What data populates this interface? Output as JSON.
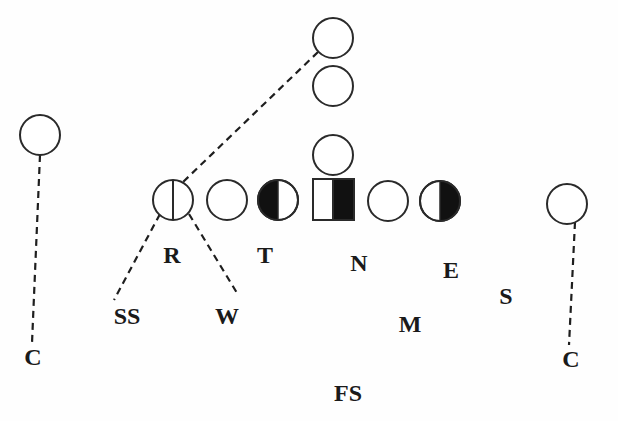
{
  "diagram": {
    "type": "football-play-formation",
    "colors": {
      "stroke": "#2a2a2a",
      "fill_dark": "#111111",
      "background": "#fefefe"
    },
    "offense": [
      {
        "id": "back-deep",
        "shape": "circle",
        "fill": "empty"
      },
      {
        "id": "back-mid",
        "shape": "circle",
        "fill": "empty"
      },
      {
        "id": "quarterback",
        "shape": "circle",
        "fill": "empty"
      },
      {
        "id": "wr-left",
        "shape": "circle",
        "fill": "empty"
      },
      {
        "id": "wr-right",
        "shape": "circle",
        "fill": "empty"
      },
      {
        "id": "line-1",
        "shape": "circle",
        "fill": "split-vertical-line"
      },
      {
        "id": "line-2",
        "shape": "circle",
        "fill": "empty"
      },
      {
        "id": "line-3",
        "shape": "circle",
        "fill": "left-half-filled"
      },
      {
        "id": "center",
        "shape": "square",
        "fill": "right-half-filled"
      },
      {
        "id": "line-5",
        "shape": "circle",
        "fill": "empty"
      },
      {
        "id": "line-6",
        "shape": "circle",
        "fill": "right-half-filled"
      }
    ],
    "defense_labels": {
      "r": "R",
      "t": "T",
      "n": "N",
      "e": "E",
      "s": "S",
      "ss": "SS",
      "w": "W",
      "m": "M",
      "c_left": "C",
      "c_right": "C",
      "fs": "FS"
    },
    "routes": [
      {
        "from": "back-deep",
        "to": "line-1",
        "style": "dashed"
      },
      {
        "from": "line-1",
        "to": "SS",
        "style": "dashed"
      },
      {
        "from": "line-1",
        "to": "W",
        "style": "dashed"
      },
      {
        "from": "wr-left",
        "to": "C-left",
        "style": "dashed"
      },
      {
        "from": "wr-right",
        "to": "C-right",
        "style": "dashed"
      }
    ]
  }
}
